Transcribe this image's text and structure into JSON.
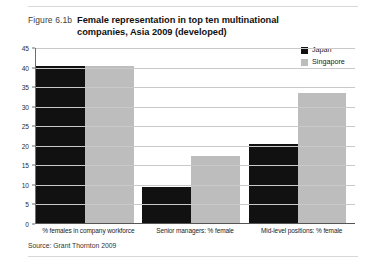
{
  "figure": {
    "number": "Figure 6.1b",
    "title": "Female representation in top ten multinational companies, Asia 2009 (developed)",
    "source": "Source: Grant Thornton 2009"
  },
  "colors": {
    "japan": "#111111",
    "singapore": "#bdbdbd",
    "gridline": "#c9c9c9",
    "axis": "#555555",
    "rule": "#d8d8d8"
  },
  "legend": {
    "position": "top-right",
    "entries": [
      {
        "label": "Japan",
        "color": "#111111"
      },
      {
        "label": "Singapore",
        "color": "#bdbdbd"
      }
    ]
  },
  "chart_data": {
    "type": "bar",
    "title": "Female representation in top ten multinational companies, Asia 2009 (developed)",
    "xlabel": "",
    "ylabel": "",
    "ylim": [
      0,
      45
    ],
    "yticks": [
      0,
      5,
      10,
      15,
      20,
      25,
      30,
      35,
      40,
      45
    ],
    "ytick_labels": [
      "0",
      "5",
      "10",
      "15",
      "20",
      "25",
      "30",
      "35",
      "40",
      "45"
    ],
    "grid": true,
    "legend_position": "top-right",
    "categories": [
      "% females in company workforce",
      "Senior managers: % female",
      "Mid-level positions: % female"
    ],
    "series": [
      {
        "name": "Japan",
        "color": "#111111",
        "values": [
          40,
          9,
          20
        ]
      },
      {
        "name": "Singapore",
        "color": "#bdbdbd",
        "values": [
          40,
          17,
          33
        ]
      }
    ]
  }
}
